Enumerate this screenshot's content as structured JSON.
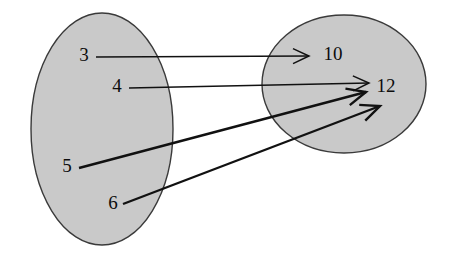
{
  "figure": {
    "kind": "mapping-diagram",
    "background_color": "#ffffff",
    "ellipse_fill_color": "#c9c9c9",
    "ellipse_stroke_color": "#3a3a3a",
    "arrow_color": "#111111",
    "text_color": "#0d0d0d"
  },
  "domain_set": {
    "name": "domain-set",
    "shape": "ellipse",
    "cx": 102,
    "cy": 129,
    "rx": 71,
    "ry": 116,
    "elements": [
      {
        "id": "d3",
        "label": "3",
        "x": 84,
        "y": 57
      },
      {
        "id": "d4",
        "label": "4",
        "x": 117,
        "y": 88
      },
      {
        "id": "d5",
        "label": "5",
        "x": 67,
        "y": 168
      },
      {
        "id": "d6",
        "label": "6",
        "x": 113,
        "y": 205
      }
    ]
  },
  "codomain_set": {
    "name": "codomain-set",
    "shape": "ellipse",
    "cx": 344,
    "cy": 84,
    "rx": 82,
    "ry": 69,
    "elements": [
      {
        "id": "c10",
        "label": "10",
        "x": 333,
        "y": 56
      },
      {
        "id": "c12",
        "label": "12",
        "x": 386,
        "y": 88
      }
    ]
  },
  "mappings": [
    {
      "id": "m1",
      "from": "3",
      "to": "10",
      "x1": 96,
      "y1": 57,
      "x2": 309,
      "y2": 56,
      "head_len": 16,
      "head_spread": 7.5,
      "width": 1.5
    },
    {
      "id": "m2",
      "from": "4",
      "to": "12",
      "x1": 129,
      "y1": 88,
      "x2": 369,
      "y2": 83,
      "head_len": 16,
      "head_spread": 7.5,
      "width": 1.5
    },
    {
      "id": "m3",
      "from": "5",
      "to": "12",
      "x1": 79,
      "y1": 168,
      "x2": 366,
      "y2": 92,
      "head_len": 19,
      "head_spread": 8.5,
      "width": 2.4
    },
    {
      "id": "m4",
      "from": "6",
      "to": "12",
      "x1": 123,
      "y1": 204,
      "x2": 380,
      "y2": 106,
      "head_len": 19,
      "head_spread": 8.5,
      "width": 2.4
    }
  ]
}
